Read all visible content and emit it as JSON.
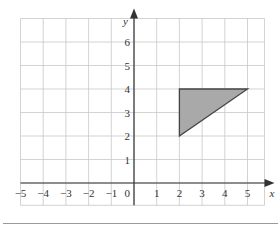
{
  "diagram": {
    "type": "coordinate-grid",
    "x_axis": {
      "label": "x",
      "min": -5,
      "max": 5,
      "ticks": [
        "−5",
        "−4",
        "−3",
        "−2",
        "−1",
        "0",
        "1",
        "2",
        "3",
        "4",
        "5"
      ]
    },
    "y_axis": {
      "label": "y",
      "min": 1,
      "max": 6,
      "ticks": [
        "1",
        "2",
        "3",
        "4",
        "5",
        "6"
      ]
    },
    "grid": {
      "x_range": [
        -5,
        6
      ],
      "y_range": [
        -1,
        7
      ],
      "color": "#c8c8c8"
    },
    "shape": {
      "name": "triangle",
      "vertices": [
        [
          2,
          4
        ],
        [
          5,
          4
        ],
        [
          2,
          2
        ]
      ],
      "fill": "#a9a9a9",
      "stroke": "#444444"
    },
    "colors": {
      "axis": "#333333",
      "separator": "#9a9a9a"
    }
  }
}
